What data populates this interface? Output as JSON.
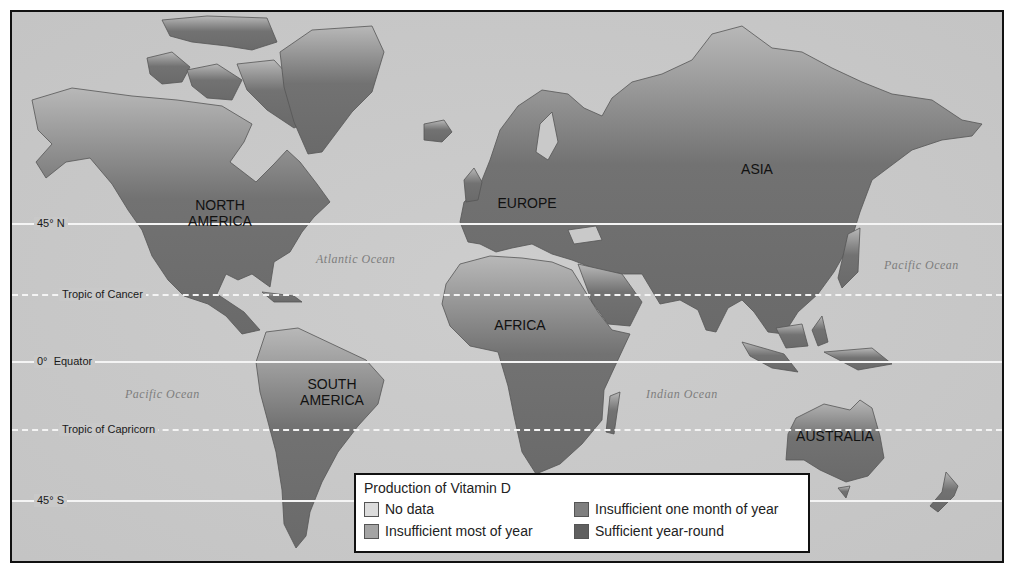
{
  "map": {
    "colors": {
      "ocean": "#c9c9c9",
      "land_dark": "#6e6e6e",
      "land_mid": "#8a8a8a",
      "land_light": "#b4b4b4",
      "lines": "#f4f4f4",
      "frame": "#111111"
    },
    "latitudes": [
      {
        "label": "45° N",
        "style": "solid"
      },
      {
        "label": "Tropic of Cancer",
        "style": "dashed"
      },
      {
        "label": "0°  Equator",
        "style": "solid"
      },
      {
        "label": "Tropic of Capricorn",
        "style": "dashed"
      },
      {
        "label": "45° S",
        "style": "solid"
      }
    ],
    "continents": [
      {
        "label": "NORTH\nAMERICA"
      },
      {
        "label": "EUROPE"
      },
      {
        "label": "ASIA"
      },
      {
        "label": "AFRICA"
      },
      {
        "label": "SOUTH\nAMERICA"
      },
      {
        "label": "AUSTRALIA"
      }
    ],
    "oceans": [
      {
        "label": "Atlantic Ocean"
      },
      {
        "label": "Pacific Ocean"
      },
      {
        "label": "Pacific Ocean"
      },
      {
        "label": "Indian Ocean"
      }
    ]
  },
  "legend": {
    "title": "Production of Vitamin D",
    "items": [
      {
        "label": "No data",
        "color": "#dcdcdc"
      },
      {
        "label": "Insufficient one month of year",
        "color": "#7f7f7f"
      },
      {
        "label": "Insufficient most of year",
        "color": "#a4a4a4"
      },
      {
        "label": "Sufficient year-round",
        "color": "#5f5f5f"
      }
    ]
  }
}
